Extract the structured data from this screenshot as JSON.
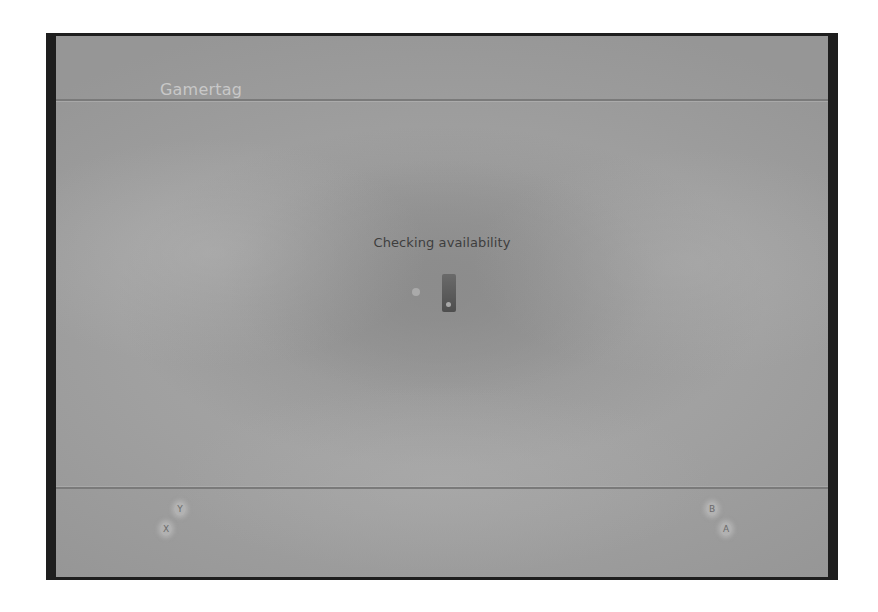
{
  "header": {
    "title": "Gamertag"
  },
  "main": {
    "status_text": "Checking availability",
    "spinner_icon": "loading-spinner-icon"
  },
  "footer": {
    "buttons": [
      {
        "key": "Y",
        "label": ""
      },
      {
        "key": "X",
        "label": ""
      },
      {
        "key": "B",
        "label": ""
      },
      {
        "key": "A",
        "label": ""
      }
    ]
  },
  "colors": {
    "frame": "#1e1e1e",
    "background": "#a0a0a0",
    "header_title": "#c8c8c8",
    "status_text": "#3e3e3e",
    "separator": "#7a7a7a"
  }
}
